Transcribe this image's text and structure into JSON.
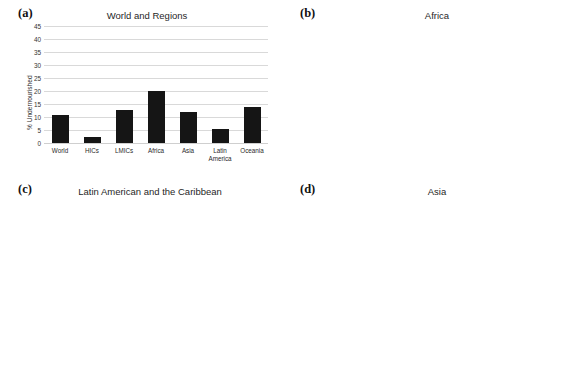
{
  "figure": {
    "y_axis_label": "% Undernourished",
    "y_ticks": [
      45,
      40,
      35,
      30,
      25,
      20,
      15,
      10,
      5,
      0
    ],
    "bar_color": "#151515",
    "grid_color": "#d9d9d9",
    "background": "#ffffff"
  },
  "panels": {
    "a": {
      "tag": "(a)",
      "title": "World and Regions"
    },
    "b": {
      "tag": "(b)",
      "title": "Africa"
    },
    "c": {
      "tag": "(c)",
      "title": "Latin American and the Caribbean"
    },
    "d": {
      "tag": "(d)",
      "title": "Asia"
    }
  },
  "chart_data": [
    {
      "panel": "(a)",
      "type": "bar",
      "title": "World and Regions",
      "xlabel": "",
      "ylabel": "% Undernourished",
      "ylim": [
        0,
        45
      ],
      "ytick_step": 5,
      "grid": true,
      "legend": "none",
      "categories": [
        "World",
        "HICs",
        "LMICs",
        "Africa",
        "Asia",
        "Latin America",
        "Oceania"
      ],
      "category_lines": [
        [
          "World"
        ],
        [
          "HICs"
        ],
        [
          "LMICs"
        ],
        [
          "Africa"
        ],
        [
          "Asia"
        ],
        [
          "Latin",
          "America"
        ],
        [
          "Oceania"
        ]
      ],
      "values": [
        10.6,
        2.3,
        12.7,
        20.0,
        11.8,
        5.5,
        14.0
      ]
    },
    {
      "panel": "(b)",
      "type": "bar",
      "title": "Africa",
      "xlabel": "",
      "ylabel": "% Undernourished",
      "ylim": [
        0,
        45
      ],
      "ytick_step": 5,
      "grid": true,
      "legend": "none",
      "categories": [
        "Africa",
        "Northern Africa",
        "Sub-Saharan Africa",
        "Eastern Africa",
        "Middle Africa",
        "Southern Africa",
        "Western Africa"
      ],
      "values": [
        20.0,
        2.3,
        23.0,
        31.5,
        41.5,
        5.0,
        9.5
      ]
    },
    {
      "panel": "(c)",
      "type": "bar",
      "title": "Latin American and the Caribbean",
      "xlabel": "",
      "ylabel": "% Undernourished",
      "ylim": [
        0,
        45
      ],
      "ytick_step": 5,
      "grid": true,
      "legend": "none",
      "categories": [
        "Latin America and The Caribbean",
        "Caribbean",
        "Latin America",
        "Central America",
        "South America"
      ],
      "category_lines": [
        [
          "Latin America and",
          "The Caribbean"
        ],
        [
          "Caribbean"
        ],
        [
          "Latin America"
        ],
        [
          "Central America"
        ],
        [
          "South America"
        ]
      ],
      "values": [
        5.0,
        19.7,
        2.2,
        6.3,
        2.0
      ]
    },
    {
      "panel": "(d)",
      "type": "bar",
      "title": "Asia",
      "xlabel": "",
      "ylabel": "% Undernourished",
      "ylim": [
        0,
        45
      ],
      "ytick_step": 5,
      "grid": true,
      "legend": "none",
      "categories": [
        "Asia",
        "Caucasus & Central Asia",
        "Eastern Asia",
        "South-Eastern Asia",
        "Southern Asia",
        "Western Asia"
      ],
      "values": [
        12.0,
        6.5,
        9.4,
        9.4,
        15.7,
        8.2
      ]
    }
  ]
}
